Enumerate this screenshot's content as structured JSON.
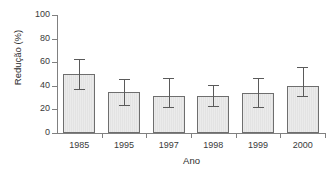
{
  "chart_data": {
    "type": "bar",
    "title": "",
    "xlabel": "Ano",
    "ylabel": "Redução (%)",
    "categories": [
      "1985",
      "1995",
      "1997",
      "1998",
      "1999",
      "2000"
    ],
    "values": [
      50,
      35,
      31,
      31,
      34,
      40
    ],
    "error_low": [
      37,
      24,
      22,
      23,
      22,
      31
    ],
    "error_high": [
      63,
      46,
      47,
      41,
      47,
      56
    ],
    "ylim": [
      0,
      100
    ],
    "yticks": [
      0,
      20,
      40,
      60,
      80,
      100
    ],
    "ytick_labels": [
      "0",
      "20",
      "40",
      "60",
      "80",
      "100"
    ],
    "grid": false,
    "legend": null,
    "bar_fill_color": "#e8e8e8",
    "bar_edge_color": "#6e6e6e",
    "error_bar_color": "#5a5a5a",
    "axis_color": "#808080",
    "background_color": "#ffffff"
  }
}
